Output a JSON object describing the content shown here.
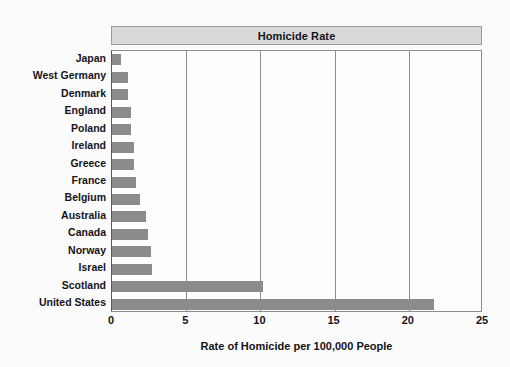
{
  "chart_data": {
    "type": "bar",
    "orientation": "horizontal",
    "title": "Homicide Rate",
    "xlabel": "Rate of Homicide per 100,000 People",
    "ylabel": "",
    "xlim": [
      0,
      25
    ],
    "xticks": [
      "0",
      "5",
      "10",
      "15",
      "20",
      "25"
    ],
    "xtick_values": [
      0,
      5,
      10,
      15,
      20,
      25
    ],
    "grid": "vertical",
    "legend": "none",
    "bar_color": "#8b8b8b",
    "title_band_color": "#d9d9d9",
    "axis_color": "#8d8d8d",
    "categories": [
      "Japan",
      "West Germany",
      "Denmark",
      "England",
      "Poland",
      "Ireland",
      "Greece",
      "France",
      "Belgium",
      "Australia",
      "Canada",
      "Norway",
      "Israel",
      "Scotland",
      "United States"
    ],
    "values": [
      0.6,
      1.1,
      1.1,
      1.3,
      1.3,
      1.5,
      1.5,
      1.6,
      1.9,
      2.3,
      2.4,
      2.6,
      2.7,
      10.2,
      21.7
    ]
  }
}
